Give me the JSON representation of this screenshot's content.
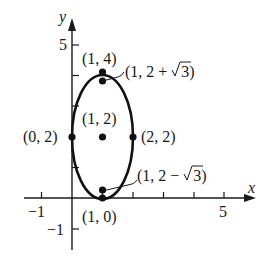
{
  "diagram": {
    "type": "ellipse-graph",
    "axes": {
      "x_label": "x",
      "y_label": "y",
      "x_ticks": [
        -1,
        1,
        2,
        3,
        4,
        5
      ],
      "y_ticks": [
        -1,
        1,
        2,
        3,
        4,
        5
      ],
      "x_tick_labels": {
        "neg": "−1",
        "pos": "5"
      },
      "y_tick_labels": {
        "neg": "−1",
        "pos": "5"
      }
    },
    "ellipse": {
      "center": [
        1,
        2
      ],
      "a": 1,
      "b": 2
    },
    "points": [
      {
        "label": "(1, 4)",
        "x": 1,
        "y": 4
      },
      {
        "label": "(1, 2 + √3)",
        "x": 1,
        "y": 3.732
      },
      {
        "label": "(1, 2)",
        "x": 1,
        "y": 2
      },
      {
        "label": "(0, 2)",
        "x": 0,
        "y": 2
      },
      {
        "label": "(2, 2)",
        "x": 2,
        "y": 2
      },
      {
        "label": "(1, 2 − √3)",
        "x": 1,
        "y": 0.268
      },
      {
        "label": "(1, 0)",
        "x": 1,
        "y": 0
      }
    ],
    "labels": {
      "p_top": "(1, 4)",
      "p_focus_top_a": "(1, 2 + ",
      "p_focus_top_b": "3)",
      "p_center": "(1, 2)",
      "p_left": "(0, 2)",
      "p_right": "(2, 2)",
      "p_focus_bot_a": "(1, 2 − ",
      "p_focus_bot_b": "3)",
      "p_bottom": "(1, 0)"
    }
  }
}
